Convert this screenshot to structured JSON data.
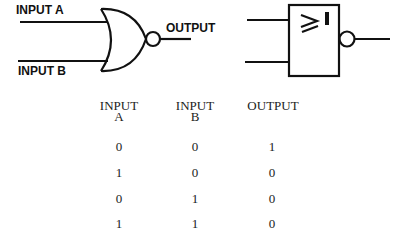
{
  "diagram": {
    "distinctive_gate": {
      "type": "NOR",
      "input_a_label": "INPUT A",
      "input_b_label": "INPUT B",
      "output_label": "OUTPUT"
    },
    "rectangular_gate": {
      "type": "NOR (IEC)",
      "symbol": "≥1"
    }
  },
  "truth_table": {
    "headers": [
      {
        "line1": "INPUT",
        "line2": "A"
      },
      {
        "line1": "INPUT",
        "line2": "B"
      },
      {
        "line1": "OUTPUT",
        "line2": ""
      }
    ],
    "rows": [
      [
        "0",
        "0",
        "1"
      ],
      [
        "1",
        "0",
        "0"
      ],
      [
        "0",
        "1",
        "0"
      ],
      [
        "1",
        "1",
        "0"
      ]
    ]
  }
}
